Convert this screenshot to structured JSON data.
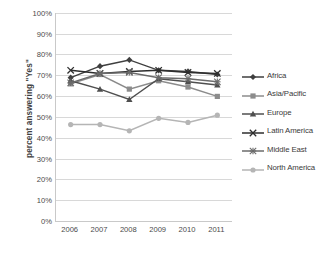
{
  "chart_data": {
    "type": "line",
    "title": "",
    "xlabel": "",
    "ylabel": "percent answering \"Yes\"",
    "categories": [
      "2006",
      "2007",
      "2008",
      "2009",
      "2010",
      "2011"
    ],
    "x": [
      2006,
      2007,
      2008,
      2009,
      2010,
      2011
    ],
    "ylim": [
      0,
      100
    ],
    "y_ticks": [
      "0%",
      "10%",
      "20%",
      "30%",
      "40%",
      "50%",
      "60%",
      "70%",
      "80%",
      "90%",
      "100%"
    ],
    "y_tick_values": [
      0,
      10,
      20,
      30,
      40,
      50,
      60,
      70,
      80,
      90,
      100
    ],
    "grid": true,
    "legend_position": "right",
    "series": [
      {
        "name": "Africa",
        "marker": "diamond",
        "color": "#3f3f3f",
        "values": [
          69,
          74.5,
          77.5,
          72.5,
          72,
          70.5
        ]
      },
      {
        "name": "Asia/Pacific",
        "marker": "square",
        "color": "#8c8c8c",
        "values": [
          66,
          70.5,
          63.5,
          67.5,
          64.5,
          60
        ]
      },
      {
        "name": "Europe",
        "marker": "triangle",
        "color": "#4f4f4f",
        "values": [
          67.5,
          63.5,
          58.5,
          68.5,
          67,
          65.5
        ]
      },
      {
        "name": "Latin America",
        "marker": "cross",
        "color": "#2e2e2e",
        "values": [
          72.5,
          71,
          72,
          72.5,
          71.5,
          71
        ]
      },
      {
        "name": "Middle East",
        "marker": "asterisk",
        "color": "#6b6b6b",
        "values": [
          66.5,
          71,
          71.5,
          69,
          68.5,
          67
        ]
      },
      {
        "name": "North America",
        "marker": "circle",
        "color": "#b5b5b5",
        "values": [
          46.5,
          46.5,
          43.5,
          49.5,
          47.5,
          51
        ]
      }
    ]
  }
}
